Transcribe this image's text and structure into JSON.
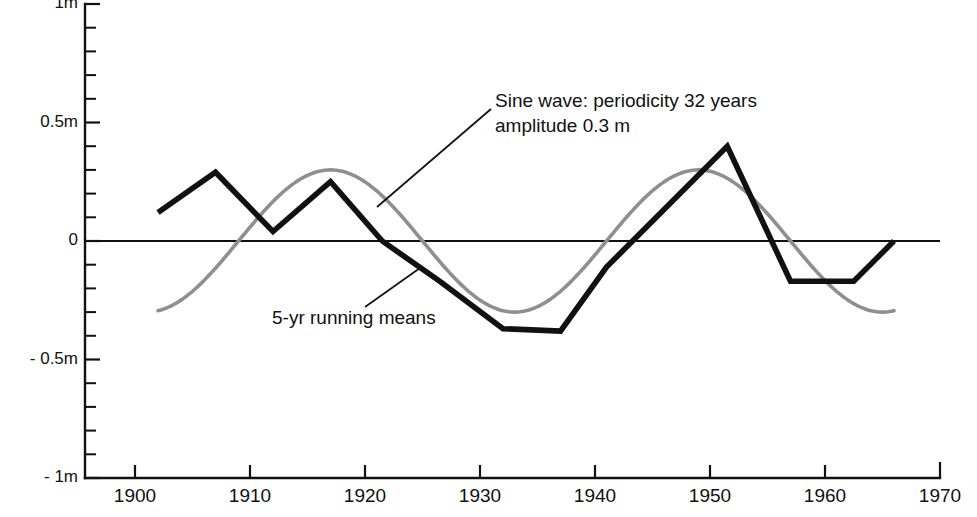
{
  "figure": {
    "background_color": "#ffffff",
    "ink_color": "#111111",
    "sine_color": "#8f8f8f",
    "clipped_caption_above": ""
  },
  "axes": {
    "y_unit_suffix": "m",
    "y_tick_labels": [
      "1m",
      "0.5m",
      "0",
      "- 0.5m",
      "- 1m"
    ],
    "y_tick_values": [
      1,
      0.5,
      0,
      -0.5,
      -1
    ],
    "y_minor_step": 0.1,
    "x_tick_labels": [
      "1900",
      "1910",
      "1920",
      "1930",
      "1940",
      "1950",
      "1960",
      "1970"
    ],
    "x_tick_values": [
      1900,
      1910,
      1920,
      1930,
      1940,
      1950,
      1960,
      1970
    ]
  },
  "annotations": [
    {
      "name": "sine-wave-annotation",
      "line1": "Sine wave: periodicity 32 years",
      "line2": "amplitude 0.3 m",
      "text_x": 495,
      "text_y": 93,
      "leader": {
        "x1": 377,
        "y1": 207,
        "x2": 491,
        "y2": 109
      }
    },
    {
      "name": "running-means-annotation",
      "line1": "5-yr running means",
      "line2": "",
      "text_x": 272,
      "text_y": 310,
      "leader": {
        "x1": 365,
        "y1": 307,
        "x2": 420,
        "y2": 268
      }
    }
  ],
  "chart_data": {
    "type": "line",
    "title": "",
    "subtitle": "",
    "xlabel": "",
    "ylabel": "",
    "xlim": [
      1897,
      1970
    ],
    "ylim": [
      -1,
      1
    ],
    "grid": false,
    "legend_position": "inline-annotations",
    "x_ticks": [
      1900,
      1910,
      1920,
      1930,
      1940,
      1950,
      1960,
      1970
    ],
    "y_ticks": [
      -1,
      -0.5,
      0,
      0.5,
      1
    ],
    "y_tick_labels": [
      "- 1m",
      "- 0.5m",
      "0",
      "0.5m",
      "1m"
    ],
    "zero_reference_line": 0,
    "series": [
      {
        "name": "5-yr running means",
        "label": "5-yr running means",
        "color": "#111111",
        "style": "polyline",
        "width": 5.6,
        "x": [
          1902.0,
          1907.0,
          1912.0,
          1917.0,
          1921.5,
          1926.5,
          1932.0,
          1937.0,
          1941.0,
          1951.5,
          1957.0,
          1962.5,
          1966.0
        ],
        "values": [
          0.12,
          0.29,
          0.04,
          0.25,
          0.0,
          -0.17,
          -0.37,
          -0.38,
          -0.11,
          0.4,
          -0.17,
          -0.17,
          0.0
        ]
      },
      {
        "name": "Sine wave",
        "label": "Sine wave: periodicity 32 years, amplitude 0.3 m",
        "color": "#8f8f8f",
        "style": "sine",
        "width": 3.6,
        "periodicity_years": 32,
        "amplitude_m": 0.3,
        "phase_peak_year": 1917.0,
        "x_start": 1902.0,
        "x_end": 1966.0
      }
    ]
  }
}
